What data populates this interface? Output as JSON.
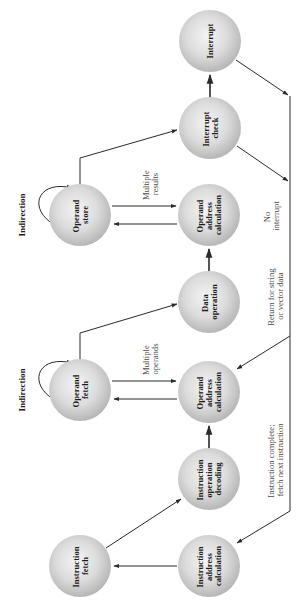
{
  "diagram": {
    "orientation": "rotated-90-ccw",
    "colors": {
      "node_light": "#eeeeee",
      "node_dark": "#b8b8b8",
      "line": "#2a2a2a",
      "edge_text": "#4a4a4a",
      "node_text": "#1a1a1a"
    },
    "nodes": {
      "interrupt": {
        "lines": [
          "Interrupt"
        ]
      },
      "interrupt_check": {
        "lines": [
          "Interrupt",
          "check"
        ]
      },
      "operand_store": {
        "lines": [
          "Operand",
          "store"
        ]
      },
      "operand_address_calc_store": {
        "lines": [
          "Operand",
          "address",
          "calculation"
        ]
      },
      "data_operation": {
        "lines": [
          "Data",
          "operation"
        ]
      },
      "operand_fetch": {
        "lines": [
          "Operand",
          "fetch"
        ]
      },
      "operand_address_calc_fetch": {
        "lines": [
          "Operand",
          "address",
          "calculation"
        ]
      },
      "instruction_operation_decoding": {
        "lines": [
          "Instruction",
          "operation",
          "decoding"
        ]
      },
      "instruction_fetch": {
        "lines": [
          "Instruction",
          "fetch"
        ]
      },
      "instruction_address_calc": {
        "lines": [
          "Instruction",
          "address",
          "calculation"
        ]
      }
    },
    "labels": {
      "indirection_store": "Indirection",
      "indirection_fetch": "Indirection",
      "multiple_results": [
        "Multiple",
        "results"
      ],
      "multiple_operands": [
        "Multiple",
        "operands"
      ],
      "no_interrupt": [
        "No",
        "interrupt"
      ],
      "return_string_vector": [
        "Return for string",
        "or vector data"
      ],
      "instruction_complete": [
        "Instruction complete;",
        "fetch next instruction"
      ]
    },
    "edges": [
      {
        "from": "Instruction address calculation",
        "to": "Instruction fetch"
      },
      {
        "from": "Instruction fetch",
        "to": "Instruction operation decoding"
      },
      {
        "from": "Instruction operation decoding",
        "to": "Operand address calculation (fetch)"
      },
      {
        "from": "Operand address calculation (fetch)",
        "to": "Operand fetch"
      },
      {
        "from": "Operand fetch",
        "to": "Operand address calculation (fetch)",
        "label": "Multiple operands"
      },
      {
        "from": "Operand fetch",
        "to": "Operand fetch",
        "label": "Indirection"
      },
      {
        "from": "Operand fetch",
        "to": "Data operation"
      },
      {
        "from": "Data operation",
        "to": "Operand address calculation (store)"
      },
      {
        "from": "Operand address calculation (store)",
        "to": "Operand store"
      },
      {
        "from": "Operand store",
        "to": "Operand address calculation (store)",
        "label": "Multiple results"
      },
      {
        "from": "Operand store",
        "to": "Operand store",
        "label": "Indirection"
      },
      {
        "from": "Operand store",
        "to": "Interrupt check"
      },
      {
        "from": "Interrupt check",
        "to": "Interrupt"
      },
      {
        "from": "Interrupt",
        "to": "return line"
      },
      {
        "from": "Interrupt check",
        "to": "return line",
        "label": "No interrupt"
      },
      {
        "from": "return line",
        "to": "Operand address calculation (fetch)",
        "label": "Return for string or vector data"
      },
      {
        "from": "return line",
        "to": "Instruction address calculation",
        "label": "Instruction complete; fetch next instruction"
      }
    ]
  }
}
